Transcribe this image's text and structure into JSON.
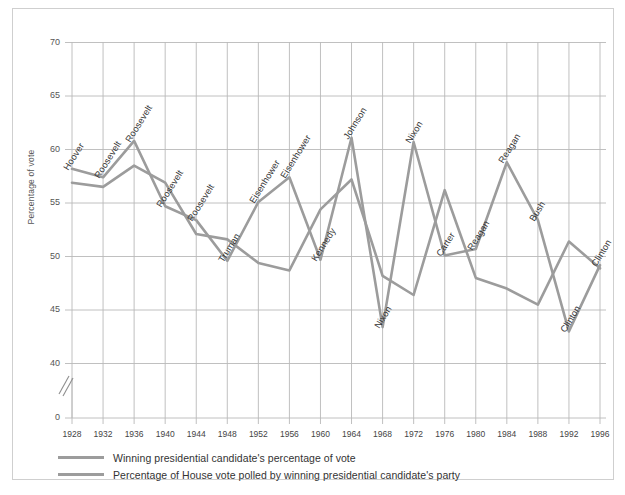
{
  "chart_data": {
    "type": "line",
    "title": "",
    "subtitle": "",
    "xlabel": "",
    "ylabel": "Percentage of vote",
    "grid": true,
    "legend_position": "bottom-left",
    "axis_break": true,
    "ylim": [
      38.5,
      71.5
    ],
    "yticks": [
      70,
      65,
      60,
      55,
      50,
      45,
      40,
      0
    ],
    "categories": [
      1928,
      1932,
      1936,
      1940,
      1944,
      1948,
      1952,
      1956,
      1960,
      1964,
      1968,
      1972,
      1976,
      1980,
      1984,
      1988,
      1992,
      1996
    ],
    "xtick_labels": [
      "1928",
      "1932",
      "1936",
      "1940",
      "1944",
      "1948",
      "1952",
      "1956",
      "1960",
      "1964",
      "1968",
      "1972",
      "1976",
      "1980",
      "1984",
      "1988",
      "1992",
      "1996"
    ],
    "series": [
      {
        "name": "Winning presidential candidate's percentage of vote",
        "color": "#9c9c9c",
        "values": [
          58.2,
          57.4,
          60.8,
          54.7,
          53.4,
          49.6,
          55.1,
          57.4,
          49.7,
          61.1,
          43.4,
          60.7,
          50.1,
          50.7,
          58.8,
          53.4,
          43.0,
          49.2
        ]
      },
      {
        "name": "Percentage of House vote polled by winning presidential candidate's party",
        "color": "#9c9c9c",
        "values": [
          56.9,
          56.5,
          58.5,
          56.9,
          52.1,
          51.6,
          49.4,
          48.7,
          54.4,
          57.2,
          48.2,
          46.4,
          56.2,
          48.0,
          47.0,
          45.5,
          51.4,
          48.9
        ]
      }
    ],
    "annotations": [
      {
        "label": "Hoover",
        "x": 1928,
        "y": 58.2,
        "series": 0
      },
      {
        "label": "Roosevelt",
        "x": 1932,
        "y": 57.4,
        "series": 0
      },
      {
        "label": "Roosevelt",
        "x": 1936,
        "y": 60.8,
        "series": 0
      },
      {
        "label": "Roosevelt",
        "x": 1940,
        "y": 54.7,
        "series": 0
      },
      {
        "label": "Roosevelt",
        "x": 1944,
        "y": 53.4,
        "series": 0
      },
      {
        "label": "Truman",
        "x": 1948,
        "y": 49.6,
        "series": 0
      },
      {
        "label": "Eisenhower",
        "x": 1952,
        "y": 55.1,
        "series": 0
      },
      {
        "label": "Eisenhower",
        "x": 1956,
        "y": 57.4,
        "series": 0
      },
      {
        "label": "Kennedy",
        "x": 1960,
        "y": 49.7,
        "series": 0
      },
      {
        "label": "Johnson",
        "x": 1964,
        "y": 61.1,
        "series": 0
      },
      {
        "label": "Nixon",
        "x": 1968,
        "y": 43.4,
        "series": 0
      },
      {
        "label": "Nixon",
        "x": 1972,
        "y": 60.7,
        "series": 0
      },
      {
        "label": "Carter",
        "x": 1976,
        "y": 50.1,
        "series": 0
      },
      {
        "label": "Reagan",
        "x": 1980,
        "y": 50.7,
        "series": 0
      },
      {
        "label": "Reagan",
        "x": 1984,
        "y": 58.8,
        "series": 0
      },
      {
        "label": "Bush",
        "x": 1988,
        "y": 53.4,
        "series": 0
      },
      {
        "label": "Clinton",
        "x": 1992,
        "y": 43.0,
        "series": 0
      },
      {
        "label": "Clinton",
        "x": 1996,
        "y": 49.2,
        "series": 0
      }
    ]
  },
  "legend": {
    "items": [
      {
        "label": "Winning presidential candidate's percentage of vote",
        "color": "#9c9c9c"
      },
      {
        "label": "Percentage of House vote polled by winning presidential candidate's party",
        "color": "#9c9c9c"
      }
    ]
  },
  "colors": {
    "line": "#9c9c9c",
    "grid": "#b9b9b9",
    "frame": "#cfcfcf",
    "text": "#333333"
  }
}
